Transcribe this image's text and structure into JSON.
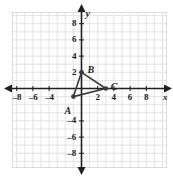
{
  "figure": {
    "kind": "cartesian-coordinate-plane",
    "background": "#ffffff",
    "grid_color": "#d9dce1",
    "axis_color": "#231f20",
    "shape_color": "#3b3b3f"
  },
  "axes": {
    "x": {
      "name": "x",
      "min": -10,
      "max": 10,
      "tick_step": 2,
      "tick_labels": [
        "–8",
        "–6",
        "–4",
        "2",
        "4",
        "6",
        "8"
      ],
      "tick_values": [
        -8,
        -6,
        -4,
        2,
        4,
        6,
        8
      ]
    },
    "y": {
      "name": "y",
      "min": -10,
      "max": 10,
      "tick_step": 2,
      "tick_labels": [
        "8",
        "6",
        "4",
        "2",
        "–4",
        "–6",
        "–8"
      ],
      "tick_values": [
        8,
        6,
        4,
        2,
        -4,
        -6,
        -8
      ]
    },
    "grid_step": 1,
    "arrows": [
      "left",
      "right",
      "up",
      "down"
    ]
  },
  "chart_data": {
    "type": "scatter",
    "title": "",
    "xlabel": "x",
    "ylabel": "y",
    "xlim": [
      -10,
      10
    ],
    "ylim": [
      -10,
      10
    ],
    "grid": true,
    "legend": "none",
    "series": [
      {
        "name": "Triangle ABC",
        "closed": true,
        "points": [
          {
            "label": "A",
            "x": -1,
            "y": -1
          },
          {
            "label": "B",
            "x": 0,
            "y": 2
          },
          {
            "label": "C",
            "x": 3,
            "y": 0
          }
        ]
      }
    ]
  },
  "vertices": [
    {
      "label": "A",
      "x": -1,
      "y": -1,
      "label_dx": -9,
      "label_dy": 9
    },
    {
      "label": "B",
      "x": 0,
      "y": 2,
      "label_dx": 6,
      "label_dy": -7
    },
    {
      "label": "C",
      "x": 3,
      "y": 0,
      "label_dx": 5,
      "label_dy": -7
    }
  ]
}
